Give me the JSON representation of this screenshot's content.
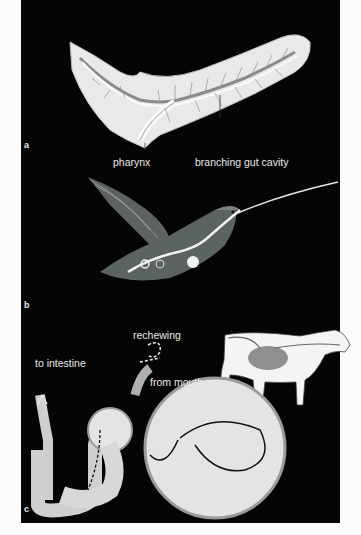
{
  "figure": {
    "background": "#050505",
    "page_background": "#fbfbfb",
    "panels": [
      {
        "id": "a",
        "subject": "flatworm with branching gut",
        "labels": [
          "pharynx",
          "branching gut cavity"
        ]
      },
      {
        "id": "b",
        "subject": "hummingbird digestive tract overlay",
        "labels": []
      },
      {
        "id": "c",
        "subject": "ruminant (cow) stomach chambers",
        "labels": [
          "rechewing",
          "to intestine",
          "from mouth"
        ]
      }
    ]
  },
  "panel_a": {
    "tag": "a",
    "pharynx": "pharynx",
    "gut": "branching gut cavity"
  },
  "panel_b": {
    "tag": "b"
  },
  "panel_c": {
    "tag": "c",
    "rechewing": "rechewing",
    "to_intestine": "to intestine",
    "from_mouth": "from mouth"
  }
}
